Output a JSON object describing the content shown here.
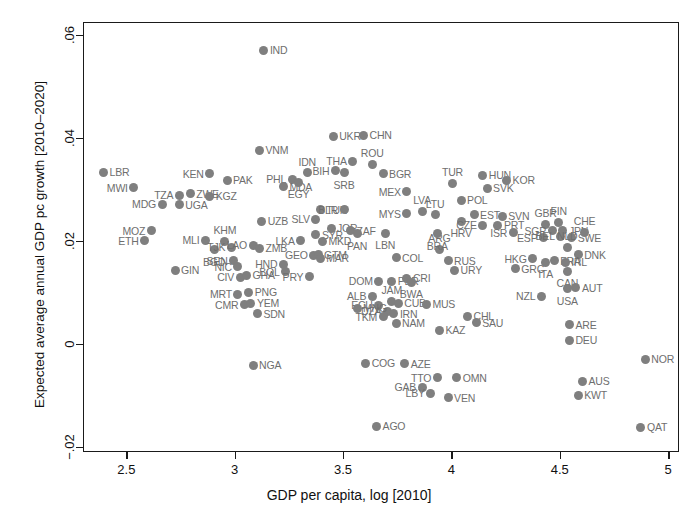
{
  "chart_data": {
    "type": "scatter",
    "title": "",
    "xlabel": "GDP per capita, log [2010]",
    "ylabel": "Expected average annual GDP pc growth [2010–2020]",
    "xlim": [
      2.3,
      5.05
    ],
    "ylim": [
      -0.021,
      0.0625
    ],
    "xticks": [
      2.5,
      3,
      3.5,
      4,
      4.5,
      5
    ],
    "xtick_labels": [
      "2.5",
      "3",
      "3.5",
      "4",
      "4.5",
      "5"
    ],
    "yticks": [
      -0.02,
      0,
      0.02,
      0.04,
      0.06
    ],
    "ytick_labels": [
      "−.02",
      "0",
      ".02",
      ".04",
      ".06"
    ],
    "grid": false,
    "legend": null,
    "marker_color": "#7f7f7f",
    "label_color": "#6e6e6e",
    "axis_color": "#1a1a1a",
    "point_label_key": "ISO3 country code",
    "points": [
      {
        "label": "LBR",
        "x": 2.39,
        "y": 0.0335,
        "pos": "r"
      },
      {
        "label": "MWI",
        "x": 2.53,
        "y": 0.0305,
        "pos": "l"
      },
      {
        "label": "MDG",
        "x": 2.66,
        "y": 0.0273,
        "pos": "l"
      },
      {
        "label": "MOZ",
        "x": 2.61,
        "y": 0.0222,
        "pos": "l"
      },
      {
        "label": "ETH",
        "x": 2.58,
        "y": 0.0202,
        "pos": "l"
      },
      {
        "label": "TZA",
        "x": 2.74,
        "y": 0.0291,
        "pos": "l"
      },
      {
        "label": "ZWE",
        "x": 2.79,
        "y": 0.0293,
        "pos": "r"
      },
      {
        "label": "UGA",
        "x": 2.74,
        "y": 0.0272,
        "pos": "r"
      },
      {
        "label": "GIN",
        "x": 2.72,
        "y": 0.0145,
        "pos": "r"
      },
      {
        "label": "MLI",
        "x": 2.86,
        "y": 0.0203,
        "pos": "l"
      },
      {
        "label": "BGD",
        "x": 2.9,
        "y": 0.0185,
        "pos": "b"
      },
      {
        "label": "KHM",
        "x": 2.95,
        "y": 0.0201,
        "pos": "t"
      },
      {
        "label": "TJK",
        "x": 2.98,
        "y": 0.019,
        "pos": "l"
      },
      {
        "label": "SEN",
        "x": 2.99,
        "y": 0.0163,
        "pos": "l"
      },
      {
        "label": "NIC",
        "x": 3.01,
        "y": 0.0152,
        "pos": "l"
      },
      {
        "label": "CIV",
        "x": 3.02,
        "y": 0.0131,
        "pos": "l"
      },
      {
        "label": "GHA",
        "x": 3.05,
        "y": 0.0135,
        "pos": "r"
      },
      {
        "label": "MRT",
        "x": 3.01,
        "y": 0.0098,
        "pos": "l"
      },
      {
        "label": "PNG",
        "x": 3.06,
        "y": 0.0102,
        "pos": "r"
      },
      {
        "label": "CMR",
        "x": 3.04,
        "y": 0.0078,
        "pos": "l"
      },
      {
        "label": "YEM",
        "x": 3.07,
        "y": 0.0081,
        "pos": "r"
      },
      {
        "label": "SDN",
        "x": 3.1,
        "y": 0.006,
        "pos": "r"
      },
      {
        "label": "NGA",
        "x": 3.08,
        "y": -0.004,
        "pos": "r"
      },
      {
        "label": "KEN",
        "x": 2.88,
        "y": 0.0332,
        "pos": "l"
      },
      {
        "label": "PAK",
        "x": 2.96,
        "y": 0.032,
        "pos": "r"
      },
      {
        "label": "KGZ",
        "x": 2.88,
        "y": 0.0289,
        "pos": "r"
      },
      {
        "label": "LAO",
        "x": 3.08,
        "y": 0.0193,
        "pos": "l"
      },
      {
        "label": "ZMB",
        "x": 3.11,
        "y": 0.0188,
        "pos": "r"
      },
      {
        "label": "UZB",
        "x": 3.12,
        "y": 0.024,
        "pos": "r"
      },
      {
        "label": "VNM",
        "x": 3.11,
        "y": 0.0378,
        "pos": "r"
      },
      {
        "label": "IND",
        "x": 3.13,
        "y": 0.0572,
        "pos": "r"
      },
      {
        "label": "PHL",
        "x": 3.26,
        "y": 0.0322,
        "pos": "l"
      },
      {
        "label": "MDA",
        "x": 3.22,
        "y": 0.0307,
        "pos": "r"
      },
      {
        "label": "IDN",
        "x": 3.33,
        "y": 0.0334,
        "pos": "t"
      },
      {
        "label": "EGY",
        "x": 3.29,
        "y": 0.0316,
        "pos": "b"
      },
      {
        "label": "HND",
        "x": 3.22,
        "y": 0.0157,
        "pos": "l"
      },
      {
        "label": "BOL",
        "x": 3.23,
        "y": 0.0142,
        "pos": "l"
      },
      {
        "label": "LKA",
        "x": 3.3,
        "y": 0.0202,
        "pos": "l"
      },
      {
        "label": "GEO",
        "x": 3.36,
        "y": 0.0174,
        "pos": "l"
      },
      {
        "label": "PRY",
        "x": 3.34,
        "y": 0.0132,
        "pos": "l"
      },
      {
        "label": "SYR",
        "x": 3.37,
        "y": 0.0214,
        "pos": "r"
      },
      {
        "label": "GTM",
        "x": 3.38,
        "y": 0.0175,
        "pos": "r"
      },
      {
        "label": "MAR",
        "x": 3.39,
        "y": 0.0168,
        "pos": "r"
      },
      {
        "label": "SLV",
        "x": 3.37,
        "y": 0.0244,
        "pos": "l"
      },
      {
        "label": "MKD",
        "x": 3.4,
        "y": 0.0201,
        "pos": "r"
      },
      {
        "label": "JOR",
        "x": 3.44,
        "y": 0.0226,
        "pos": "r"
      },
      {
        "label": "ZAF",
        "x": 3.53,
        "y": 0.0222,
        "pos": "r"
      },
      {
        "label": "PAN",
        "x": 3.56,
        "y": 0.0216,
        "pos": "b"
      },
      {
        "label": "TUN",
        "x": 3.39,
        "y": 0.0262,
        "pos": "r"
      },
      {
        "label": "BLR",
        "x": 3.5,
        "y": 0.0262,
        "pos": "l"
      },
      {
        "label": "BIH",
        "x": 3.46,
        "y": 0.0338,
        "pos": "l"
      },
      {
        "label": "SRB",
        "x": 3.5,
        "y": 0.0334,
        "pos": "b"
      },
      {
        "label": "THA",
        "x": 3.54,
        "y": 0.0357,
        "pos": "l"
      },
      {
        "label": "UKR",
        "x": 3.45,
        "y": 0.0405,
        "pos": "r"
      },
      {
        "label": "CHN",
        "x": 3.59,
        "y": 0.0407,
        "pos": "r"
      },
      {
        "label": "ROU",
        "x": 3.63,
        "y": 0.0351,
        "pos": "t"
      },
      {
        "label": "BGR",
        "x": 3.68,
        "y": 0.0332,
        "pos": "r"
      },
      {
        "label": "MEX",
        "x": 3.79,
        "y": 0.0297,
        "pos": "l"
      },
      {
        "label": "MYS",
        "x": 3.79,
        "y": 0.0255,
        "pos": "l"
      },
      {
        "label": "LVA",
        "x": 3.86,
        "y": 0.0259,
        "pos": "t"
      },
      {
        "label": "LTU",
        "x": 3.92,
        "y": 0.0253,
        "pos": "t"
      },
      {
        "label": "LBN",
        "x": 3.69,
        "y": 0.0217,
        "pos": "b"
      },
      {
        "label": "COL",
        "x": 3.74,
        "y": 0.0169,
        "pos": "r"
      },
      {
        "label": "DOM",
        "x": 3.66,
        "y": 0.0124,
        "pos": "l"
      },
      {
        "label": "PER",
        "x": 3.72,
        "y": 0.0124,
        "pos": "r"
      },
      {
        "label": "CRI",
        "x": 3.79,
        "y": 0.0129,
        "pos": "r"
      },
      {
        "label": "BWA",
        "x": 3.81,
        "y": 0.0122,
        "pos": "b"
      },
      {
        "label": "ALB",
        "x": 3.63,
        "y": 0.0094,
        "pos": "l"
      },
      {
        "label": "ECU",
        "x": 3.66,
        "y": 0.0077,
        "pos": "l"
      },
      {
        "label": "JAM",
        "x": 3.72,
        "y": 0.0085,
        "pos": "t"
      },
      {
        "label": "CUB",
        "x": 3.75,
        "y": 0.0081,
        "pos": "r"
      },
      {
        "label": "DZA",
        "x": 3.7,
        "y": 0.0065,
        "pos": "l"
      },
      {
        "label": "IRN",
        "x": 3.73,
        "y": 0.006,
        "pos": "r"
      },
      {
        "label": "TKM",
        "x": 3.68,
        "y": 0.0055,
        "pos": "l"
      },
      {
        "label": "NAM",
        "x": 3.74,
        "y": 0.0042,
        "pos": "r"
      },
      {
        "label": "MNG",
        "x": 3.56,
        "y": 0.0071,
        "pos": "r"
      },
      {
        "label": "COG",
        "x": 3.6,
        "y": -0.0036,
        "pos": "r"
      },
      {
        "label": "AZE",
        "x": 3.78,
        "y": -0.0037,
        "pos": "r"
      },
      {
        "label": "AGO",
        "x": 3.65,
        "y": -0.0158,
        "pos": "r"
      },
      {
        "label": "GAB",
        "x": 3.86,
        "y": -0.0082,
        "pos": "l"
      },
      {
        "label": "LBY",
        "x": 3.9,
        "y": -0.0094,
        "pos": "l"
      },
      {
        "label": "VEN",
        "x": 3.98,
        "y": -0.0103,
        "pos": "r"
      },
      {
        "label": "TTO",
        "x": 3.93,
        "y": -0.0064,
        "pos": "l"
      },
      {
        "label": "OMN",
        "x": 4.02,
        "y": -0.0064,
        "pos": "r"
      },
      {
        "label": "KAZ",
        "x": 3.94,
        "y": 0.0028,
        "pos": "r"
      },
      {
        "label": "MUS",
        "x": 3.88,
        "y": 0.0079,
        "pos": "r"
      },
      {
        "label": "CHL",
        "x": 4.07,
        "y": 0.0056,
        "pos": "r"
      },
      {
        "label": "SAU",
        "x": 4.11,
        "y": 0.0043,
        "pos": "r"
      },
      {
        "label": "ARG",
        "x": 3.94,
        "y": 0.0186,
        "pos": "t"
      },
      {
        "label": "RUS",
        "x": 3.98,
        "y": 0.0163,
        "pos": "r"
      },
      {
        "label": "URY",
        "x": 4.01,
        "y": 0.0145,
        "pos": "r"
      },
      {
        "label": "BRA",
        "x": 3.93,
        "y": 0.0216,
        "pos": "b"
      },
      {
        "label": "TUR",
        "x": 4.0,
        "y": 0.0314,
        "pos": "t"
      },
      {
        "label": "POL",
        "x": 4.04,
        "y": 0.0281,
        "pos": "r"
      },
      {
        "label": "HRV",
        "x": 4.04,
        "y": 0.024,
        "pos": "b"
      },
      {
        "label": "EST",
        "x": 4.1,
        "y": 0.0253,
        "pos": "r"
      },
      {
        "label": "CZE",
        "x": 4.14,
        "y": 0.0232,
        "pos": "l"
      },
      {
        "label": "HUN",
        "x": 4.14,
        "y": 0.0329,
        "pos": "r"
      },
      {
        "label": "SVK",
        "x": 4.16,
        "y": 0.0304,
        "pos": "r"
      },
      {
        "label": "KOR",
        "x": 4.25,
        "y": 0.032,
        "pos": "r"
      },
      {
        "label": "SVN",
        "x": 4.23,
        "y": 0.025,
        "pos": "r"
      },
      {
        "label": "PRT",
        "x": 4.21,
        "y": 0.0232,
        "pos": "r"
      },
      {
        "label": "ISR",
        "x": 4.28,
        "y": 0.0218,
        "pos": "l"
      },
      {
        "label": "GRC",
        "x": 4.29,
        "y": 0.0148,
        "pos": "r"
      },
      {
        "label": "HKG",
        "x": 4.37,
        "y": 0.0167,
        "pos": "l"
      },
      {
        "label": "GBR",
        "x": 4.43,
        "y": 0.0234,
        "pos": "t"
      },
      {
        "label": "FIN",
        "x": 4.49,
        "y": 0.0238,
        "pos": "t"
      },
      {
        "label": "SGP",
        "x": 4.46,
        "y": 0.0222,
        "pos": "l"
      },
      {
        "label": "JPN",
        "x": 4.51,
        "y": 0.0222,
        "pos": "r"
      },
      {
        "label": "ESP",
        "x": 4.42,
        "y": 0.0208,
        "pos": "l"
      },
      {
        "label": "BEL",
        "x": 4.5,
        "y": 0.0211,
        "pos": "l"
      },
      {
        "label": "SWE",
        "x": 4.55,
        "y": 0.0208,
        "pos": "r"
      },
      {
        "label": "CHE",
        "x": 4.61,
        "y": 0.0219,
        "pos": "t"
      },
      {
        "label": "NLD",
        "x": 4.53,
        "y": 0.019,
        "pos": "t"
      },
      {
        "label": "DNK",
        "x": 4.58,
        "y": 0.0175,
        "pos": "r"
      },
      {
        "label": "FRA",
        "x": 4.47,
        "y": 0.0163,
        "pos": "r"
      },
      {
        "label": "ITA",
        "x": 4.43,
        "y": 0.016,
        "pos": "b"
      },
      {
        "label": "IRL",
        "x": 4.52,
        "y": 0.016,
        "pos": "r"
      },
      {
        "label": "CAN",
        "x": 4.53,
        "y": 0.0143,
        "pos": "b"
      },
      {
        "label": "USA",
        "x": 4.53,
        "y": 0.0109,
        "pos": "b"
      },
      {
        "label": "AUT",
        "x": 4.57,
        "y": 0.0111,
        "pos": "r"
      },
      {
        "label": "NZL",
        "x": 4.41,
        "y": 0.0094,
        "pos": "l"
      },
      {
        "label": "ARE",
        "x": 4.54,
        "y": 0.0039,
        "pos": "r"
      },
      {
        "label": "DEU",
        "x": 4.54,
        "y": 0.0009,
        "pos": "r"
      },
      {
        "label": "AUS",
        "x": 4.6,
        "y": -0.0071,
        "pos": "r"
      },
      {
        "label": "KWT",
        "x": 4.58,
        "y": -0.0098,
        "pos": "r"
      },
      {
        "label": "NOR",
        "x": 4.89,
        "y": -0.0028,
        "pos": "r"
      },
      {
        "label": "QAT",
        "x": 4.87,
        "y": -0.016,
        "pos": "r"
      }
    ]
  }
}
